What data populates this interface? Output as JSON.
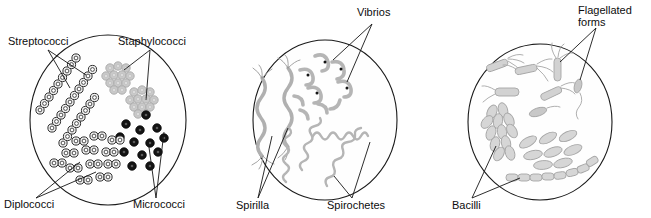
{
  "figure": {
    "background_color": "#ffffff",
    "line_color": "#151515",
    "field_count": 3
  },
  "palette": {
    "outline": "#1a1a1a",
    "ring_cell": "#3a3a3a",
    "light_gray_cell": "#b9b9b9",
    "mid_gray_cell": "#a8a8a8",
    "dark_cell": "#121212",
    "leader_line": "#151515",
    "label_text": "#0d0d0d"
  },
  "fields": [
    {
      "id": "field-cocci",
      "name": "cocci-field",
      "center": {
        "cx": 108,
        "cy": 120
      },
      "radius": {
        "rx": 78,
        "ry": 85
      },
      "labels": [
        {
          "id": "label-streptococci",
          "text": "Streptococci",
          "name": "label-streptococci",
          "x": 8,
          "y": 45,
          "anchor": "start",
          "targets": [
            "streptococci-chain-1",
            "streptococci-chain-2"
          ]
        },
        {
          "id": "label-staphylococci",
          "text": "Staphylococci",
          "name": "label-staphylococci",
          "x": 118,
          "y": 45,
          "anchor": "start",
          "targets": [
            "staphylococci-cluster-1",
            "staphylococci-cluster-2"
          ]
        },
        {
          "id": "label-diplococci",
          "text": "Diplococci",
          "name": "label-diplococci",
          "x": 4,
          "y": 208,
          "anchor": "start",
          "targets": [
            "diplococci-group-1",
            "diplococci-group-2"
          ]
        },
        {
          "id": "label-micrococci",
          "text": "Micrococci",
          "name": "label-micrococci",
          "x": 133,
          "y": 208,
          "anchor": "start",
          "targets": [
            "micrococci-group-1",
            "micrococci-group-2"
          ]
        }
      ],
      "specimens": [
        {
          "id": "streptococci-chain-1",
          "type": "chain-of-cocci",
          "style": "ring",
          "cell_count": 11
        },
        {
          "id": "streptococci-chain-2",
          "type": "chain-of-cocci",
          "style": "ring",
          "cell_count": 10
        },
        {
          "id": "streptococci-chain-3",
          "type": "chain-of-cocci",
          "style": "ring",
          "cell_count": 9
        },
        {
          "id": "staphylococci-cluster-1",
          "type": "grape-cluster",
          "style": "light-gray",
          "cell_count": 11
        },
        {
          "id": "staphylococci-cluster-2",
          "type": "grape-cluster",
          "style": "light-gray",
          "cell_count": 13
        },
        {
          "id": "diplococci-group-1",
          "type": "paired-cocci",
          "style": "ring",
          "pair_count": 7
        },
        {
          "id": "diplococci-group-2",
          "type": "paired-cocci",
          "style": "ring",
          "pair_count": 6
        },
        {
          "id": "micrococci-group-1",
          "type": "single-cocci",
          "style": "dark",
          "cell_count": 13
        }
      ]
    },
    {
      "id": "field-spiral",
      "name": "spiral-field",
      "center": {
        "cx": 325,
        "cy": 120
      },
      "radius": {
        "rx": 72,
        "ry": 80
      },
      "labels": [
        {
          "id": "label-vibrios",
          "text": "Vibrios",
          "name": "label-vibrios",
          "x": 357,
          "y": 16,
          "anchor": "start",
          "targets": [
            "vibrio-group-1",
            "vibrio-group-2"
          ]
        },
        {
          "id": "label-spirilla",
          "text": "Spirilla",
          "name": "label-spirilla",
          "x": 236,
          "y": 209,
          "anchor": "start",
          "targets": [
            "spirillum-1",
            "spirillum-2"
          ]
        },
        {
          "id": "label-spirochetes",
          "text": "Spirochetes",
          "name": "label-spirochetes",
          "x": 327,
          "y": 209,
          "anchor": "start",
          "targets": [
            "spirochete-1",
            "spirochete-2"
          ]
        }
      ],
      "specimens": [
        {
          "id": "spirillum-1",
          "type": "spirillum",
          "style": "thick-wavy-rod",
          "flagella": "tufts-both-ends"
        },
        {
          "id": "spirillum-2",
          "type": "spirillum",
          "style": "thick-wavy-rod",
          "flagella": "tufts-both-ends"
        },
        {
          "id": "vibrio-group-1",
          "type": "comma-shaped",
          "style": "gray-with-dot",
          "cell_count": 9
        },
        {
          "id": "spirochete-1",
          "type": "helical-filament",
          "style": "thin-coil"
        },
        {
          "id": "spirochete-2",
          "type": "helical-filament",
          "style": "thin-coil"
        },
        {
          "id": "spirochete-3",
          "type": "helical-filament",
          "style": "thin-coil"
        },
        {
          "id": "spirochete-4",
          "type": "helical-filament",
          "style": "thin-coil"
        }
      ]
    },
    {
      "id": "field-bacilli",
      "name": "bacilli-field",
      "center": {
        "cx": 540,
        "cy": 122
      },
      "radius": {
        "rx": 72,
        "ry": 78
      },
      "labels": [
        {
          "id": "label-flagellated-forms",
          "text": "Flagellated",
          "text_line2": "forms",
          "name": "label-flagellated-forms",
          "x": 578,
          "y": 14,
          "anchor": "start",
          "targets": [
            "flagellated-rod-1",
            "flagellated-rod-2"
          ]
        },
        {
          "id": "label-bacilli",
          "text": "Bacilli",
          "name": "label-bacilli",
          "x": 452,
          "y": 209,
          "anchor": "start",
          "targets": [
            "bacilli-cluster",
            "bacilli-chain"
          ]
        }
      ],
      "specimens": [
        {
          "id": "flagellated-rod-1",
          "type": "rod-with-flagella",
          "style": "gray-outline",
          "flagella": "tuft"
        },
        {
          "id": "flagellated-rod-2",
          "type": "rod-with-flagella",
          "style": "gray-outline",
          "flagella": "tuft"
        },
        {
          "id": "flagellated-rod-3",
          "type": "rod-with-flagella",
          "style": "gray-outline",
          "flagella": "tuft"
        },
        {
          "id": "flagellated-rod-4",
          "type": "rod-with-flagella",
          "style": "gray-outline",
          "flagella": "tuft"
        },
        {
          "id": "flagellated-rod-5",
          "type": "rod-with-single-flagellum",
          "style": "gray-outline",
          "flagella": "monotrichous"
        },
        {
          "id": "bacilli-cluster",
          "type": "rod-cluster",
          "style": "gray-outline",
          "cell_count": 12
        },
        {
          "id": "bacilli-scattered",
          "type": "single-rods",
          "style": "gray-outline",
          "cell_count": 8
        },
        {
          "id": "bacilli-chain",
          "type": "rod-chain",
          "style": "gray-outline",
          "cell_count": 9
        }
      ]
    }
  ]
}
